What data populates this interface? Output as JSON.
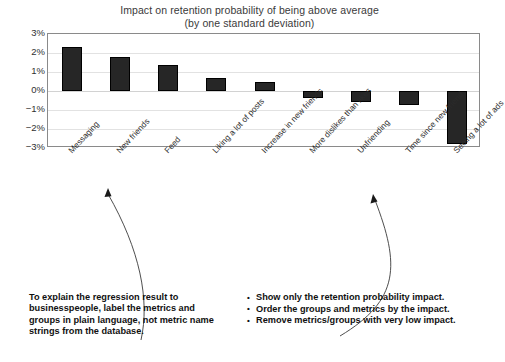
{
  "chart_data": {
    "type": "bar",
    "title": "Impact on retention probability of being above average",
    "subtitle": "(by one standard deviation)",
    "xlabel": "",
    "ylabel": "",
    "ylim": [
      -3,
      3
    ],
    "ytick_labels": [
      "3%",
      "2%",
      "1%",
      "0%",
      "−1%",
      "−2%",
      "−3%"
    ],
    "ytick_values": [
      3,
      2,
      1,
      0,
      -1,
      -2,
      -3
    ],
    "grid": true,
    "legend": "none",
    "bar_color": "#262626",
    "categories": [
      "Messaging",
      "New friends",
      "Feed",
      "Liking a lot of posts",
      "Increase in new friends",
      "More dislikes than likes",
      "Unfriending",
      "Time since new friend",
      "Seeing a lot of ads"
    ],
    "values": [
      2.3,
      1.8,
      1.35,
      0.7,
      0.45,
      -0.35,
      -0.6,
      -0.75,
      -2.8
    ]
  },
  "annotations": {
    "left_note": "To explain the regression result to businesspeople, label the metrics and groups in plain language, not metric name strings from the database.",
    "right_bullets": [
      "Show only the retention probability impact.",
      "Order the groups and metrics by the impact.",
      "Remove metrics/groups with very low impact."
    ]
  }
}
